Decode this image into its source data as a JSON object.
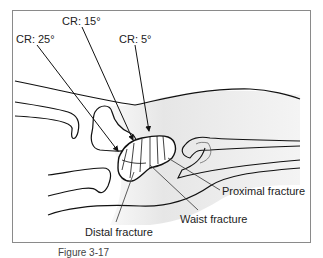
{
  "diagram": {
    "ray_labels": [
      {
        "id": "cr25",
        "text": "CR: 25°"
      },
      {
        "id": "cr15",
        "text": "CR: 15°"
      },
      {
        "id": "cr5",
        "text": "CR: 5°"
      }
    ],
    "fracture_labels": [
      {
        "id": "proximal",
        "text": "Proximal fracture"
      },
      {
        "id": "waist",
        "text": "Waist fracture"
      },
      {
        "id": "distal",
        "text": "Distal fracture"
      }
    ],
    "caption": "Figure 3-17"
  }
}
